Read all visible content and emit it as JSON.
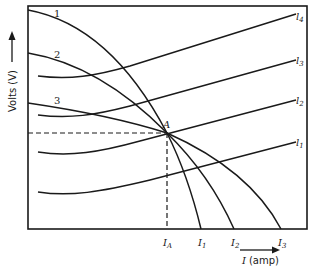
{
  "diagram": {
    "type": "voltage-current characteristic curves",
    "y_axis_label": "Volts (V)",
    "x_axis_label_symbol": "I",
    "x_axis_label_unit": "(amp)",
    "operating_point_label": "A",
    "source_curves": [
      {
        "id": "1",
        "label": "1",
        "x_intercept_label": "I",
        "x_intercept_sub": "1"
      },
      {
        "id": "2",
        "label": "2",
        "x_intercept_label": "I",
        "x_intercept_sub": "2"
      },
      {
        "id": "3",
        "label": "3",
        "x_intercept_label": "I",
        "x_intercept_sub": "3"
      }
    ],
    "load_lines": [
      {
        "label": "l",
        "sub": "4"
      },
      {
        "label": "l",
        "sub": "3"
      },
      {
        "label": "l",
        "sub": "2"
      },
      {
        "label": "l",
        "sub": "1"
      }
    ],
    "operating_current_label": "I",
    "operating_current_sub": "A"
  }
}
